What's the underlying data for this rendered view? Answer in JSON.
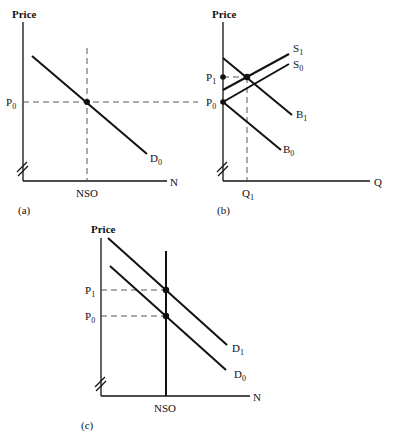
{
  "panels": {
    "a": {
      "caption": "(a)",
      "y_label": "Price",
      "x_label": "N",
      "price_label": "P",
      "price_sub": "0",
      "x_tick": "NSO",
      "curve_label": "D",
      "curve_sub": "0"
    },
    "b": {
      "caption": "(b)",
      "y_label": "Price",
      "x_label": "Q",
      "p1_label": "P",
      "p1_sub": "1",
      "p0_label": "P",
      "p0_sub": "0",
      "x_tick": "Q",
      "x_tick_sub": "1",
      "s1_label": "S",
      "s1_sub": "1",
      "s0_label": "S",
      "s0_sub": "0",
      "b1_label": "B",
      "b1_sub": "1",
      "b0_label": "B",
      "b0_sub": "0"
    },
    "c": {
      "caption": "(c)",
      "y_label": "Price",
      "x_label": "N",
      "p1_label": "P",
      "p1_sub": "1",
      "p0_label": "P",
      "p0_sub": "0",
      "x_tick": "NSO",
      "d1_label": "D",
      "d1_sub": "1",
      "d0_label": "D",
      "d0_sub": "0"
    }
  }
}
